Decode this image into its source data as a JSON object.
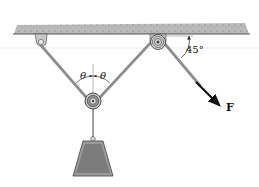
{
  "figure": {
    "type": "pulley-system",
    "labels": {
      "theta_left": "θ",
      "theta_right": "θ",
      "angle": "45°",
      "force": "F"
    },
    "colors": {
      "ceiling": "#b5b5b5",
      "rope": "#8a8a8a",
      "weight_outer": "#9a9a9a",
      "weight_inner": "#7c7c7c",
      "arrow": "#111111"
    }
  }
}
